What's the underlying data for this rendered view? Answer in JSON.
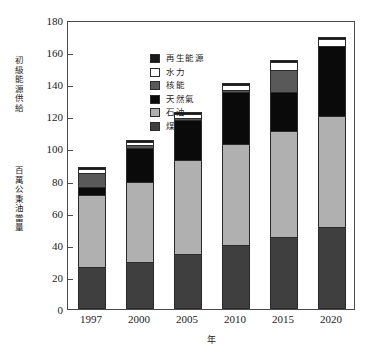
{
  "chart_data": {
    "type": "bar",
    "stacked": true,
    "title": "",
    "xlabel": "年",
    "ylabel": "初級能源供給",
    "ylabel_secondary": "百萬公秉油當量",
    "categories": [
      "1997",
      "2000",
      "2005",
      "2010",
      "2015",
      "2020"
    ],
    "ylim": [
      0,
      180
    ],
    "yticks": [
      0,
      20,
      40,
      60,
      80,
      100,
      120,
      140,
      160,
      180
    ],
    "grid": false,
    "legend_position": "top-left",
    "series": [
      {
        "name": "煤",
        "color": "#3f3f3f",
        "values": [
          26,
          29,
          34,
          40,
          45,
          51
        ]
      },
      {
        "name": "石油",
        "color": "#b0b0b0",
        "values": [
          45,
          50,
          59,
          63,
          66,
          69
        ]
      },
      {
        "name": "天然氣",
        "color": "#0a0a0a",
        "values": [
          5,
          21,
          25,
          32,
          24,
          44
        ]
      },
      {
        "name": "核能",
        "color": "#595959",
        "values": [
          9,
          2,
          1,
          1,
          14,
          0
        ]
      },
      {
        "name": "水力",
        "color": "#ffffff",
        "values": [
          2,
          2,
          2,
          3,
          5,
          4
        ]
      },
      {
        "name": "再生能源",
        "color": "#1a1a1a",
        "values": [
          0.5,
          0.5,
          0.5,
          0.5,
          0.5,
          0.5
        ]
      }
    ],
    "totals": [
      87.5,
      104.5,
      121.5,
      139.5,
      154.5,
      168.5
    ]
  },
  "axis": {
    "y_ticks": [
      "180",
      "160",
      "140",
      "120",
      "100",
      "80",
      "60",
      "40",
      "20",
      "0"
    ],
    "x_ticks": [
      "1997",
      "2000",
      "2005",
      "2010",
      "2015",
      "2020"
    ],
    "x_title": "年",
    "y_title_primary": "初級能源供給",
    "y_title_secondary": "百萬公秉油當量"
  },
  "legend": {
    "items": [
      {
        "label": "再生能源",
        "swatch": "legend-swatch-renewable"
      },
      {
        "label": "水力",
        "swatch": "legend-swatch-hydro"
      },
      {
        "label": "核能",
        "swatch": "legend-swatch-nuclear"
      },
      {
        "label": "天然氣",
        "swatch": "legend-swatch-natural-gas"
      },
      {
        "label": "石油",
        "swatch": "legend-swatch-oil"
      },
      {
        "label": "煤",
        "swatch": "legend-swatch-coal"
      }
    ]
  }
}
